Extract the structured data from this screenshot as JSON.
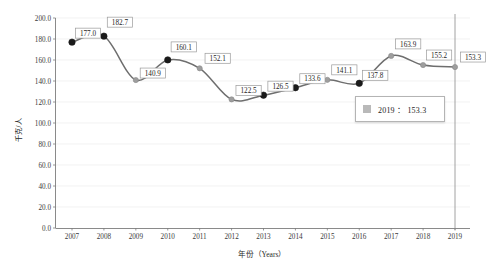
{
  "chart_data": {
    "type": "line",
    "title": "",
    "xlabel": "年份（Years）",
    "ylabel": "千克/人",
    "categories": [
      "2007",
      "2008",
      "2009",
      "2010",
      "2011",
      "2012",
      "2013",
      "2014",
      "2015",
      "2016",
      "2017",
      "2018",
      "2019"
    ],
    "values": [
      177.0,
      182.7,
      140.9,
      160.1,
      152.1,
      122.5,
      126.5,
      133.6,
      141.1,
      137.8,
      163.9,
      155.2,
      153.3
    ],
    "point_labels": [
      "177.0",
      "182.7",
      "140.9",
      "160.1",
      "152.1",
      "122.5",
      "126.5",
      "133.6",
      "141.1",
      "137.8",
      "163.9",
      "155.2",
      "153.3"
    ],
    "marker_styles": [
      "dark",
      "dark",
      "light",
      "dark",
      "light",
      "light",
      "dark",
      "dark",
      "light",
      "dark",
      "light",
      "light",
      "light"
    ],
    "ylim": [
      0,
      200
    ],
    "ytick_step": 20,
    "ytick_labels": [
      "0.0",
      "20.0",
      "40.0",
      "60.0",
      "80.0",
      "100.0",
      "120.0",
      "140.0",
      "160.0",
      "180.0",
      "200.0"
    ],
    "xtick_labels": [
      "2007",
      "2008",
      "2009",
      "2010",
      "2011",
      "2012",
      "2013",
      "2014",
      "2015",
      "2016",
      "2017",
      "2018",
      "2019"
    ],
    "grid": true,
    "legend_position": "none",
    "series": [
      {
        "name": "千克/人",
        "values": [
          177.0,
          182.7,
          140.9,
          160.1,
          152.1,
          122.5,
          126.5,
          133.6,
          141.1,
          137.8,
          163.9,
          155.2,
          153.3
        ]
      }
    ],
    "annotations": {
      "crosshair_year": "2019",
      "tooltip": "2019：153.3"
    },
    "colors": {
      "line": "#6e6e6e",
      "marker_dark": "#1a1a1a",
      "marker_light": "#9e9e9e",
      "grid": "#e9e9e9",
      "axis": "#7d7d7d",
      "crosshair": "#8c8c8c",
      "label_box_border": "#9a9a9a",
      "background": "#ffffff"
    }
  },
  "tooltip": {
    "year": "2019",
    "separator": "：",
    "value": "153.3",
    "text": "2019 ： 153.3"
  }
}
